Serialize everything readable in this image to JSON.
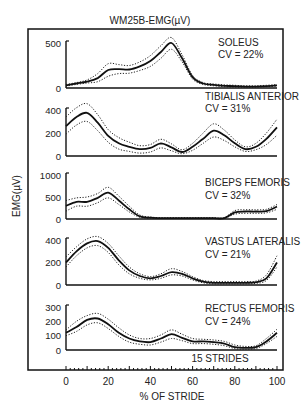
{
  "chart_data": {
    "type": "line",
    "title": "WM25B-EMG(µV)",
    "xlabel": "% OF STRIDE",
    "ylabel": "EMG(µV)",
    "x_ticks": [
      0,
      20,
      40,
      60,
      80,
      100
    ],
    "xlim": [
      0,
      100
    ],
    "note": "15 STRIDES",
    "grid": false,
    "legend": "none; mean (solid) ± 1 SD (dotted) per panel",
    "x": [
      0,
      5,
      10,
      15,
      20,
      25,
      30,
      35,
      40,
      45,
      50,
      55,
      60,
      65,
      70,
      75,
      80,
      85,
      90,
      95,
      100
    ],
    "panels": [
      {
        "name": "SOLEUS",
        "cv": "CV = 22%",
        "ylim": [
          0,
          500
        ],
        "y_ticks": [
          0,
          500
        ],
        "mean": [
          30,
          50,
          70,
          110,
          200,
          210,
          205,
          240,
          300,
          400,
          500,
          330,
          120,
          50,
          35,
          25,
          20,
          15,
          15,
          20,
          30
        ],
        "upper": [
          40,
          60,
          90,
          160,
          270,
          260,
          250,
          290,
          360,
          470,
          560,
          370,
          140,
          60,
          45,
          35,
          30,
          25,
          25,
          30,
          40
        ],
        "lower": [
          20,
          40,
          55,
          70,
          130,
          160,
          165,
          195,
          240,
          330,
          430,
          290,
          100,
          40,
          25,
          15,
          10,
          10,
          10,
          15,
          20
        ]
      },
      {
        "name": "TIBIALIS ANTERIOR",
        "cv": "CV = 31%",
        "ylim": [
          0,
          400
        ],
        "y_ticks": [
          0,
          200,
          400
        ],
        "mean": [
          260,
          340,
          375,
          290,
          175,
          110,
          80,
          60,
          70,
          110,
          75,
          35,
          80,
          150,
          220,
          180,
          110,
          60,
          80,
          150,
          250
        ],
        "upper": [
          340,
          420,
          455,
          360,
          230,
          160,
          120,
          90,
          100,
          145,
          105,
          55,
          110,
          200,
          280,
          225,
          140,
          80,
          110,
          200,
          320
        ],
        "lower": [
          190,
          270,
          300,
          220,
          120,
          60,
          40,
          25,
          35,
          70,
          45,
          20,
          50,
          110,
          165,
          135,
          80,
          40,
          55,
          100,
          180
        ]
      },
      {
        "name": "BICEPS FEMORIS",
        "cv": "CV = 32%",
        "ylim": [
          0,
          1000
        ],
        "y_ticks": [
          0,
          500,
          1000
        ],
        "mean": [
          300,
          390,
          390,
          480,
          600,
          420,
          220,
          60,
          30,
          20,
          20,
          20,
          20,
          20,
          20,
          20,
          150,
          170,
          170,
          180,
          280
        ],
        "upper": [
          420,
          480,
          500,
          580,
          720,
          520,
          290,
          90,
          45,
          30,
          30,
          30,
          30,
          30,
          30,
          30,
          190,
          210,
          210,
          220,
          330
        ],
        "lower": [
          180,
          290,
          290,
          370,
          480,
          330,
          160,
          40,
          20,
          15,
          15,
          15,
          15,
          15,
          15,
          15,
          110,
          130,
          130,
          140,
          220
        ]
      },
      {
        "name": "VASTUS LATERALIS",
        "cv": "CV = 21%",
        "ylim": [
          0,
          400
        ],
        "y_ticks": [
          0,
          200,
          400
        ],
        "mean": [
          200,
          300,
          370,
          390,
          330,
          220,
          130,
          80,
          60,
          80,
          115,
          100,
          60,
          30,
          20,
          20,
          20,
          20,
          25,
          60,
          200
        ],
        "upper": [
          250,
          340,
          410,
          430,
          370,
          260,
          160,
          100,
          75,
          100,
          145,
          120,
          75,
          40,
          30,
          30,
          30,
          30,
          35,
          90,
          260
        ],
        "lower": [
          160,
          260,
          330,
          350,
          290,
          180,
          100,
          60,
          45,
          60,
          90,
          80,
          45,
          20,
          10,
          10,
          10,
          10,
          15,
          40,
          160
        ]
      },
      {
        "name": "RECTUS FEMORIS",
        "cv": "CV = 24%",
        "ylim": [
          0,
          300
        ],
        "y_ticks": [
          0,
          100,
          200,
          300
        ],
        "mean": [
          120,
          160,
          210,
          220,
          180,
          120,
          80,
          60,
          55,
          80,
          110,
          85,
          60,
          60,
          55,
          45,
          20,
          15,
          20,
          60,
          120
        ],
        "upper": [
          140,
          200,
          240,
          255,
          215,
          155,
          105,
          80,
          80,
          105,
          140,
          110,
          80,
          75,
          70,
          60,
          35,
          25,
          30,
          80,
          145
        ],
        "lower": [
          100,
          130,
          175,
          190,
          150,
          95,
          55,
          40,
          35,
          55,
          80,
          65,
          45,
          45,
          40,
          30,
          10,
          5,
          10,
          45,
          95
        ]
      }
    ]
  },
  "figure": {
    "title": "WM25B-EMG(µV)",
    "ylabel": "EMG(µV)",
    "xlabel": "% OF STRIDE",
    "strides_note": "15 STRIDES"
  }
}
